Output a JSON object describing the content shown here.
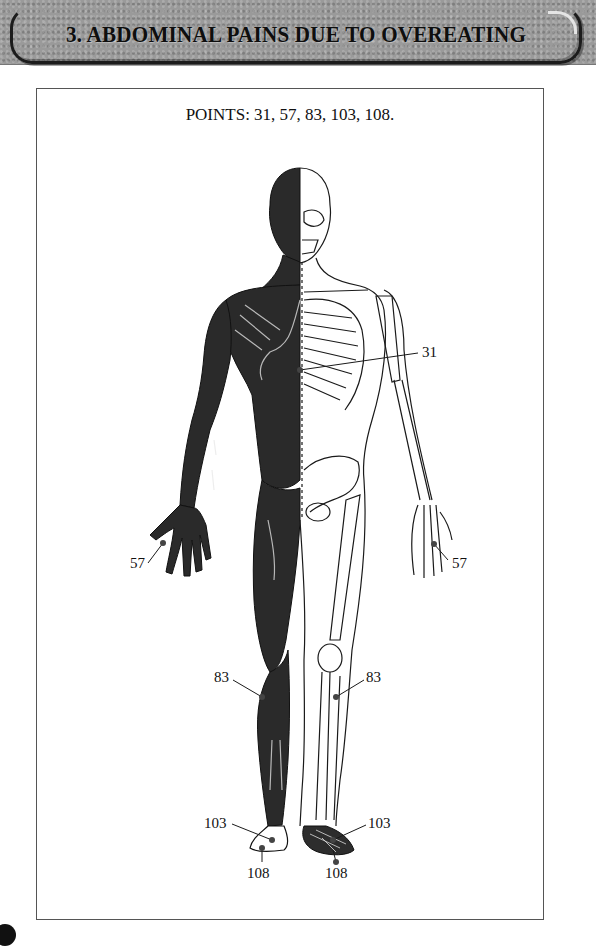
{
  "header": {
    "title": "3.  ABDOMINAL PAINS DUE TO OVEREATING"
  },
  "figure": {
    "points_heading": "POINTS: 31, 57, 83, 103, 108.",
    "labels": [
      {
        "id": "31-right",
        "text": "31",
        "x": 422,
        "y": 345,
        "line": [
          300,
          370,
          418,
          353
        ]
      },
      {
        "id": "57-left",
        "text": "57",
        "x": 130,
        "y": 556,
        "line": [
          148,
          563,
          163,
          543
        ]
      },
      {
        "id": "57-right",
        "text": "57",
        "x": 452,
        "y": 556,
        "line": [
          448,
          560,
          434,
          544
        ]
      },
      {
        "id": "83-left",
        "text": "83",
        "x": 214,
        "y": 670,
        "line": [
          233,
          680,
          262,
          697
        ]
      },
      {
        "id": "83-right",
        "text": "83",
        "x": 366,
        "y": 670,
        "line": [
          364,
          680,
          336,
          697
        ]
      },
      {
        "id": "103-left",
        "text": "103",
        "x": 204,
        "y": 816,
        "line": [
          232,
          824,
          272,
          840
        ]
      },
      {
        "id": "103-right",
        "text": "103",
        "x": 368,
        "y": 816,
        "line": [
          366,
          825,
          333,
          840
        ]
      },
      {
        "id": "108-left",
        "text": "108",
        "x": 247,
        "y": 866,
        "line": [
          262,
          862,
          262,
          848
        ]
      },
      {
        "id": "108-right",
        "text": "108",
        "x": 325,
        "y": 866,
        "line": [
          336,
          862,
          333,
          850
        ]
      }
    ]
  },
  "colors": {
    "banner_bg": "#9a9a9a",
    "muscle": "#2a2a2a",
    "line": "#1a1a1a"
  }
}
